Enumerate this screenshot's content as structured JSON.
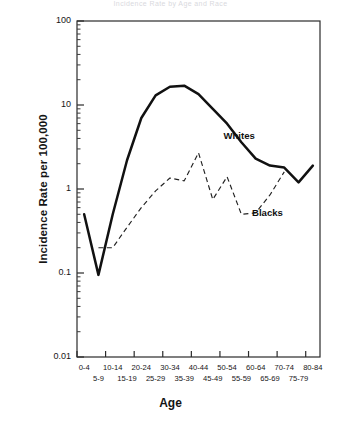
{
  "figure": {
    "title": "Incidence Rate by Age and Race",
    "axis_title_x": "Age",
    "axis_title_y": "Incidence Rate per 100,000"
  },
  "yaxis": {
    "ticks": [
      {
        "label": "100",
        "value": 100
      },
      {
        "label": "10",
        "value": 10
      },
      {
        "label": "1",
        "value": 1
      },
      {
        "label": "0.1",
        "value": 0.1
      },
      {
        "label": "0.01",
        "value": 0.01
      }
    ]
  },
  "series_labels": {
    "whites": "Whites",
    "blacks": "Blacks"
  },
  "chart_data": {
    "type": "line",
    "title": "Incidence Rate by Age and Race",
    "xlabel": "Age",
    "ylabel": "Incidence Rate per 100,000",
    "yscale": "log",
    "ylim": [
      0.01,
      100
    ],
    "grid": false,
    "legend_position": "inline-annotation",
    "categories": [
      "0-4",
      "5-9",
      "10-14",
      "15-19",
      "20-24",
      "25-29",
      "30-34",
      "35-39",
      "40-44",
      "45-49",
      "50-54",
      "55-59",
      "60-64",
      "65-69",
      "70-74",
      "75-79",
      "80-84"
    ],
    "series": [
      {
        "name": "Whites",
        "style": "solid",
        "color": "#111111",
        "values": [
          0.5,
          0.095,
          0.5,
          2.2,
          7.0,
          13.0,
          16.5,
          17.0,
          13.5,
          9.0,
          6.0,
          3.6,
          2.3,
          1.9,
          1.8,
          1.2,
          1.9
        ]
      },
      {
        "name": "Blacks",
        "style": "dashed",
        "color": "#222222",
        "values": [
          null,
          0.2,
          0.2,
          0.35,
          0.6,
          0.95,
          1.35,
          1.25,
          2.7,
          0.75,
          1.4,
          0.5,
          0.52,
          0.85,
          1.6,
          null,
          null
        ]
      }
    ],
    "annotations": [
      {
        "text": "Whites",
        "category": "55-59",
        "value": 4.2
      },
      {
        "text": "Blacks",
        "category": "65-69",
        "value": 0.5
      }
    ]
  }
}
